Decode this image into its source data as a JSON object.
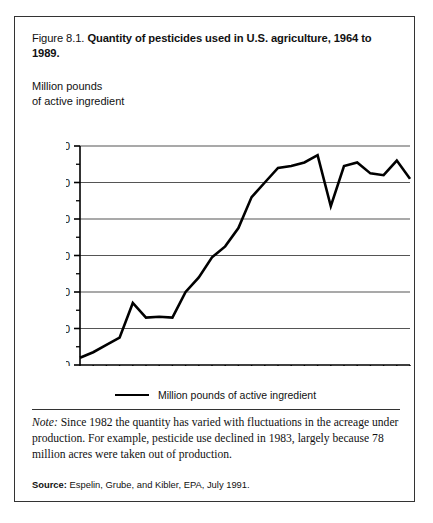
{
  "figure": {
    "number": "Figure 8.1.",
    "title": "Quantity of pesticides used in U.S. agriculture, 1964 to 1989.",
    "y_axis_caption": "Million pounds\nof active ingredient",
    "legend_label": "Million pounds of active ingredient",
    "note_label": "Note:",
    "note_text": " Since 1982 the quantity has varied with fluctuations in the acreage under production.  For example, pesticide use declined in 1983, largely because 78 million acres were taken out of production.",
    "source_label": "Source:",
    "source_text": "  Espelin, Grube, and Kibler, EPA, July 1991.",
    "colors": {
      "line": "#000000",
      "grid": "#555555",
      "axis": "#000000",
      "border": "#333333",
      "background": "#ffffff"
    }
  },
  "chart_data": {
    "type": "line",
    "title": "Quantity of pesticides used in U.S. agriculture, 1964 to 1989",
    "xlabel": "",
    "ylabel": "Million pounds of active ingredient",
    "xlim": [
      1964,
      1989
    ],
    "ylim": [
      300,
      900
    ],
    "xticks": [
      1964,
      1965,
      1966,
      1967,
      1968,
      1969,
      1970,
      1971,
      1972,
      1973,
      1974,
      1975,
      1976,
      1977,
      1978,
      1979,
      1980,
      1981,
      1982,
      1983,
      1984,
      1985,
      1986,
      1987,
      1988,
      1989
    ],
    "xticklabels": [
      "1964",
      "",
      "",
      "",
      "",
      "1969",
      "",
      "",
      "",
      "",
      "1974",
      "",
      "",
      "",
      "",
      "1979",
      "",
      "",
      "",
      "",
      "1984",
      "",
      "",
      "",
      "",
      "1989"
    ],
    "yticks": [
      300,
      400,
      500,
      600,
      700,
      800,
      900
    ],
    "yticklabels": [
      "300",
      "400",
      "500",
      "600",
      "700",
      "800",
      "900"
    ],
    "y_minor_ticks": [
      350,
      450,
      550,
      650,
      750,
      850
    ],
    "grid": true,
    "grid_axis": "y",
    "legend": [
      "Million pounds of active ingredient"
    ],
    "legend_position": "bottom",
    "x": [
      1964,
      1965,
      1966,
      1967,
      1968,
      1969,
      1970,
      1971,
      1972,
      1973,
      1974,
      1975,
      1976,
      1977,
      1978,
      1979,
      1980,
      1981,
      1982,
      1983,
      1984,
      1985,
      1986,
      1987,
      1988,
      1989
    ],
    "values": [
      320,
      335,
      355,
      375,
      470,
      430,
      432,
      430,
      500,
      540,
      595,
      625,
      675,
      760,
      800,
      840,
      845,
      855,
      875,
      735,
      845,
      855,
      825,
      820,
      860,
      810
    ],
    "series": [
      {
        "name": "Million pounds of active ingredient",
        "values": [
          320,
          335,
          355,
          375,
          470,
          430,
          432,
          430,
          500,
          540,
          595,
          625,
          675,
          760,
          800,
          840,
          845,
          855,
          875,
          735,
          845,
          855,
          825,
          820,
          860,
          810
        ]
      }
    ]
  }
}
